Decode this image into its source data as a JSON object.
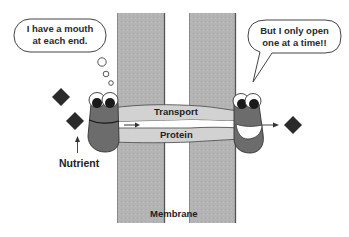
{
  "diagram": {
    "type": "membrane-transport-cartoon",
    "colors": {
      "membrane": "#b4b4b4",
      "membrane_edge": "#6e6e6e",
      "protein_band": "#d2d2d2",
      "channel": "#ffffff",
      "character_body": "#6c6c6c",
      "diamond": "#2a2a2a",
      "text": "#222222"
    },
    "left_bubble": {
      "line1": "I have a mouth",
      "line2": "at each end."
    },
    "right_bubble": {
      "line1": "But I only open",
      "line2": "one at a time!!"
    },
    "protein": {
      "top_label": "Transport",
      "bottom_label": "Protein"
    },
    "nutrient_label": "Nutrient",
    "membrane_label": "Membrane"
  }
}
